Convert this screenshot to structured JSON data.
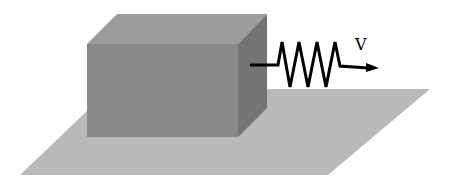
{
  "diagram": {
    "labels": {
      "velocity": "V"
    },
    "colors": {
      "floor": "#b8b8b8",
      "box_front": "#8a8a8a",
      "box_top": "#9c9c9c",
      "box_side": "#747474",
      "spring": "#000000"
    }
  }
}
